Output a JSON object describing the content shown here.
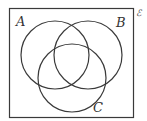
{
  "diagram": {
    "type": "venn",
    "universal_label": "ℰ",
    "sets": [
      {
        "label": "A"
      },
      {
        "label": "B"
      },
      {
        "label": "C"
      }
    ],
    "stroke_color": "#3a3a3a",
    "background": "#ffffff"
  }
}
